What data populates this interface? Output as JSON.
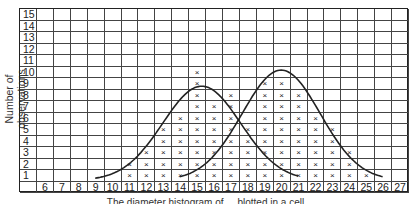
{
  "chart_data": {
    "type": "bar",
    "style": "tally-histogram",
    "title": "",
    "xlabel": "The diameter histogram of ... blotted in a cell",
    "ylabel": "Number of observations",
    "categories": [
      6,
      7,
      8,
      9,
      10,
      11,
      12,
      13,
      14,
      15,
      16,
      17,
      18,
      19,
      20,
      21,
      22,
      23,
      24,
      25,
      26,
      27
    ],
    "values": [
      0,
      0,
      0,
      0,
      0,
      2,
      3,
      5,
      6,
      10,
      7,
      8,
      5,
      9,
      9,
      8,
      6,
      5,
      3,
      1,
      0,
      0
    ],
    "y_ticks": [
      1,
      2,
      3,
      4,
      5,
      6,
      7,
      8,
      9,
      10,
      11,
      12,
      13,
      14,
      15
    ],
    "ylim": [
      0,
      15
    ],
    "grid": true,
    "marker": "x",
    "fitted_curves": [
      {
        "name": "left distribution",
        "peak_x": 15.3,
        "peak_y": 8.2,
        "range": [
          9,
          21
        ]
      },
      {
        "name": "right distribution",
        "peak_x": 20.0,
        "peak_y": 9.6,
        "range": [
          14,
          26
        ]
      }
    ]
  },
  "labels": {
    "ylabel": "Number of observations",
    "caption": "The diameter histogram of ... blotted in a cell",
    "mark": "×"
  }
}
